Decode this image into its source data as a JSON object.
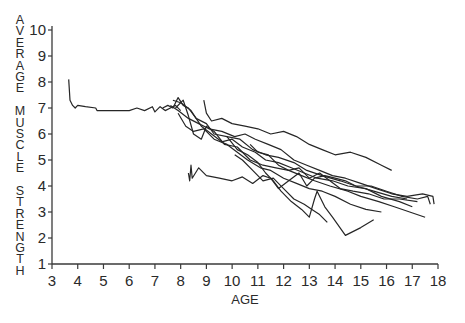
{
  "chart_data": {
    "type": "line",
    "title": "",
    "xlabel": "AGE",
    "ylabel": "AVERAGE MUSCLE STRENGTH",
    "xlim": [
      3,
      18
    ],
    "ylim": [
      1,
      10
    ],
    "x_ticks": [
      3,
      4,
      5,
      6,
      7,
      8,
      9,
      10,
      11,
      12,
      13,
      14,
      15,
      16,
      17,
      18
    ],
    "y_ticks": [
      1,
      2,
      3,
      4,
      5,
      6,
      7,
      8,
      9,
      10
    ],
    "grid": false,
    "legend": null,
    "note": "Individual longitudinal trajectories (spaghetti plot); values estimated from pixels",
    "series": [
      {
        "name": "subject-1",
        "points": [
          [
            3.65,
            8.1
          ],
          [
            3.7,
            7.3
          ],
          [
            3.8,
            7.1
          ],
          [
            3.9,
            7.0
          ],
          [
            4.0,
            7.1
          ],
          [
            4.3,
            7.05
          ],
          [
            4.7,
            7.0
          ],
          [
            4.75,
            6.9
          ],
          [
            5.3,
            6.9
          ],
          [
            6.0,
            6.9
          ],
          [
            6.3,
            7.0
          ],
          [
            6.6,
            6.9
          ],
          [
            6.9,
            7.05
          ],
          [
            7.0,
            6.85
          ],
          [
            7.2,
            7.05
          ],
          [
            7.4,
            6.9
          ],
          [
            7.6,
            7.0
          ],
          [
            7.8,
            7.1
          ],
          [
            8.0,
            6.9
          ]
        ]
      },
      {
        "name": "subject-2",
        "points": [
          [
            7.3,
            7.0
          ],
          [
            7.5,
            7.1
          ],
          [
            7.7,
            7.0
          ],
          [
            7.9,
            7.4
          ],
          [
            8.1,
            7.1
          ],
          [
            8.3,
            7.0
          ],
          [
            8.6,
            6.6
          ],
          [
            9.0,
            6.4
          ],
          [
            9.3,
            6.0
          ],
          [
            9.8,
            5.9
          ],
          [
            10.3,
            5.8
          ],
          [
            10.8,
            5.4
          ],
          [
            11.3,
            5.2
          ],
          [
            11.8,
            5.1
          ],
          [
            12.4,
            4.9
          ],
          [
            12.9,
            4.6
          ],
          [
            13.5,
            4.4
          ],
          [
            14.2,
            4.2
          ],
          [
            14.8,
            4.0
          ],
          [
            15.5,
            3.8
          ],
          [
            16.2,
            3.6
          ],
          [
            16.8,
            3.5
          ]
        ]
      },
      {
        "name": "subject-3",
        "points": [
          [
            7.7,
            7.3
          ],
          [
            8.0,
            7.2
          ],
          [
            8.4,
            6.9
          ],
          [
            8.8,
            6.3
          ],
          [
            9.2,
            6.0
          ],
          [
            9.6,
            5.7
          ],
          [
            10.0,
            5.8
          ],
          [
            10.4,
            5.5
          ],
          [
            10.9,
            5.3
          ],
          [
            11.3,
            5.0
          ],
          [
            11.8,
            4.9
          ],
          [
            12.3,
            4.7
          ],
          [
            12.8,
            4.5
          ],
          [
            13.3,
            4.3
          ],
          [
            13.9,
            4.2
          ],
          [
            14.5,
            4.0
          ],
          [
            15.2,
            3.9
          ],
          [
            15.8,
            3.6
          ],
          [
            16.5,
            3.4
          ],
          [
            17.0,
            3.2
          ]
        ]
      },
      {
        "name": "subject-4",
        "points": [
          [
            7.8,
            7.0
          ],
          [
            8.1,
            7.3
          ],
          [
            8.3,
            6.7
          ],
          [
            8.5,
            6.0
          ],
          [
            8.8,
            5.8
          ],
          [
            9.0,
            6.3
          ],
          [
            9.3,
            6.1
          ],
          [
            9.7,
            5.6
          ],
          [
            10.2,
            5.5
          ],
          [
            10.7,
            5.0
          ],
          [
            11.2,
            4.8
          ],
          [
            11.7,
            4.7
          ],
          [
            12.2,
            4.6
          ],
          [
            12.7,
            4.4
          ],
          [
            13.2,
            4.2
          ],
          [
            13.8,
            4.0
          ],
          [
            14.5,
            3.8
          ],
          [
            15.0,
            3.6
          ],
          [
            15.7,
            3.4
          ],
          [
            16.3,
            3.2
          ],
          [
            16.9,
            3.0
          ],
          [
            17.5,
            2.8
          ]
        ]
      },
      {
        "name": "subject-5",
        "points": [
          [
            7.9,
            6.8
          ],
          [
            8.2,
            6.3
          ],
          [
            8.5,
            6.1
          ],
          [
            8.9,
            6.2
          ],
          [
            9.3,
            5.8
          ],
          [
            9.8,
            5.6
          ],
          [
            10.2,
            5.3
          ],
          [
            10.6,
            5.0
          ],
          [
            11.1,
            4.7
          ],
          [
            11.5,
            4.6
          ],
          [
            12.0,
            4.3
          ],
          [
            12.5,
            4.1
          ],
          [
            13.0,
            3.9
          ],
          [
            13.5,
            3.8
          ],
          [
            14.0,
            3.6
          ],
          [
            14.6,
            3.3
          ],
          [
            15.2,
            3.1
          ],
          [
            15.8,
            3.0
          ]
        ]
      },
      {
        "name": "subject-6",
        "points": [
          [
            7.6,
            7.1
          ],
          [
            7.9,
            6.9
          ],
          [
            8.3,
            6.6
          ],
          [
            8.7,
            6.4
          ],
          [
            9.1,
            6.2
          ],
          [
            9.6,
            6.1
          ],
          [
            10.1,
            5.9
          ],
          [
            10.5,
            6.0
          ],
          [
            10.9,
            5.8
          ],
          [
            11.4,
            5.6
          ],
          [
            11.9,
            5.4
          ],
          [
            12.4,
            5.0
          ],
          [
            12.9,
            4.8
          ],
          [
            13.4,
            4.6
          ],
          [
            13.9,
            4.4
          ],
          [
            14.4,
            4.3
          ],
          [
            15.0,
            4.1
          ],
          [
            15.6,
            3.9
          ],
          [
            16.2,
            3.7
          ],
          [
            16.8,
            3.6
          ],
          [
            17.4,
            3.7
          ],
          [
            17.8,
            3.6
          ],
          [
            17.85,
            3.3
          ]
        ]
      },
      {
        "name": "subject-7",
        "points": [
          [
            8.9,
            7.3
          ],
          [
            9.0,
            6.8
          ],
          [
            9.2,
            6.5
          ],
          [
            9.6,
            6.6
          ],
          [
            10.0,
            6.4
          ],
          [
            10.5,
            6.3
          ],
          [
            11.0,
            6.2
          ],
          [
            11.5,
            6.0
          ],
          [
            12.0,
            6.1
          ],
          [
            12.5,
            5.9
          ],
          [
            13.0,
            5.6
          ],
          [
            13.5,
            5.4
          ],
          [
            14.0,
            5.2
          ],
          [
            14.6,
            5.3
          ],
          [
            15.2,
            5.1
          ],
          [
            15.8,
            4.8
          ],
          [
            16.2,
            4.6
          ]
        ]
      },
      {
        "name": "subject-8",
        "points": [
          [
            8.3,
            4.5
          ],
          [
            8.35,
            4.2
          ],
          [
            8.4,
            4.8
          ],
          [
            8.45,
            4.3
          ],
          [
            8.7,
            4.7
          ],
          [
            9.0,
            4.4
          ],
          [
            9.5,
            4.3
          ],
          [
            10.0,
            4.2
          ],
          [
            10.4,
            4.35
          ],
          [
            10.8,
            4.1
          ],
          [
            11.2,
            4.4
          ],
          [
            11.5,
            4.3
          ],
          [
            11.8,
            3.9
          ],
          [
            12.2,
            4.2
          ],
          [
            12.6,
            4.5
          ],
          [
            12.9,
            4.0
          ],
          [
            13.2,
            4.3
          ],
          [
            13.6,
            4.4
          ],
          [
            14.0,
            4.3
          ],
          [
            14.4,
            4.2
          ],
          [
            14.8,
            4.0
          ],
          [
            15.4,
            4.0
          ],
          [
            16.0,
            3.8
          ],
          [
            16.6,
            3.6
          ],
          [
            17.2,
            3.5
          ],
          [
            17.6,
            3.6
          ],
          [
            17.7,
            3.3
          ]
        ]
      },
      {
        "name": "subject-9",
        "points": [
          [
            9.8,
            5.9
          ],
          [
            10.2,
            5.4
          ],
          [
            10.6,
            5.2
          ],
          [
            11.0,
            4.9
          ],
          [
            11.3,
            4.5
          ],
          [
            11.6,
            4.2
          ],
          [
            11.9,
            3.8
          ],
          [
            12.3,
            3.4
          ],
          [
            12.7,
            3.1
          ],
          [
            13.0,
            2.8
          ],
          [
            13.2,
            3.5
          ],
          [
            13.3,
            3.8
          ],
          [
            13.6,
            3.2
          ],
          [
            13.9,
            2.8
          ],
          [
            14.4,
            2.1
          ],
          [
            15.0,
            2.4
          ],
          [
            15.5,
            2.7
          ]
        ]
      },
      {
        "name": "subject-10",
        "points": [
          [
            10.1,
            5.2
          ],
          [
            10.4,
            5.0
          ],
          [
            10.8,
            4.6
          ],
          [
            11.2,
            4.2
          ],
          [
            11.6,
            4.3
          ],
          [
            12.0,
            3.9
          ],
          [
            12.4,
            3.5
          ],
          [
            12.8,
            3.3
          ],
          [
            13.1,
            3.1
          ],
          [
            13.4,
            2.9
          ],
          [
            13.7,
            2.6
          ]
        ]
      },
      {
        "name": "subject-11",
        "points": [
          [
            10.7,
            5.6
          ],
          [
            11.0,
            5.3
          ],
          [
            11.4,
            5.2
          ],
          [
            11.8,
            4.8
          ],
          [
            12.2,
            4.6
          ],
          [
            12.6,
            4.7
          ],
          [
            13.0,
            4.3
          ],
          [
            13.4,
            4.5
          ],
          [
            13.8,
            4.2
          ],
          [
            14.2,
            3.9
          ],
          [
            14.7,
            3.8
          ],
          [
            15.3,
            3.7
          ],
          [
            15.9,
            3.5
          ],
          [
            16.5,
            3.5
          ],
          [
            17.2,
            3.4
          ]
        ]
      }
    ]
  },
  "axes": {
    "x_title": "AGE",
    "y_title_letters": [
      "A",
      "V",
      "E",
      "R",
      "A",
      "G",
      "E",
      "",
      "M",
      "U",
      "S",
      "C",
      "L",
      "E",
      "",
      "S",
      "T",
      "R",
      "E",
      "N",
      "G",
      "T",
      "H"
    ]
  },
  "style": {
    "line_color": "#262626",
    "axis_color": "#3a3a3a",
    "background": "#ffffff"
  }
}
